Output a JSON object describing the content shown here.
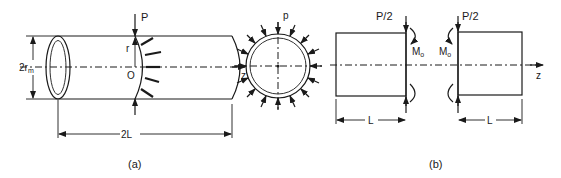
{
  "figure": {
    "panel_a": {
      "caption": "(a)",
      "labels": {
        "load": "P",
        "radius": "r",
        "origin": "O",
        "diameter": "2r",
        "diameter_sub": "m",
        "length": "2L",
        "axis": "z"
      }
    },
    "cross_section": {
      "label_pressure": "p"
    },
    "panel_b": {
      "caption": "(b)",
      "left_half": {
        "load": "P/2",
        "moment": "M",
        "moment_sub": "o",
        "length": "L"
      },
      "right_half": {
        "load": "P/2",
        "moment": "M",
        "moment_sub": "o",
        "length": "L"
      },
      "axis": "z"
    }
  }
}
